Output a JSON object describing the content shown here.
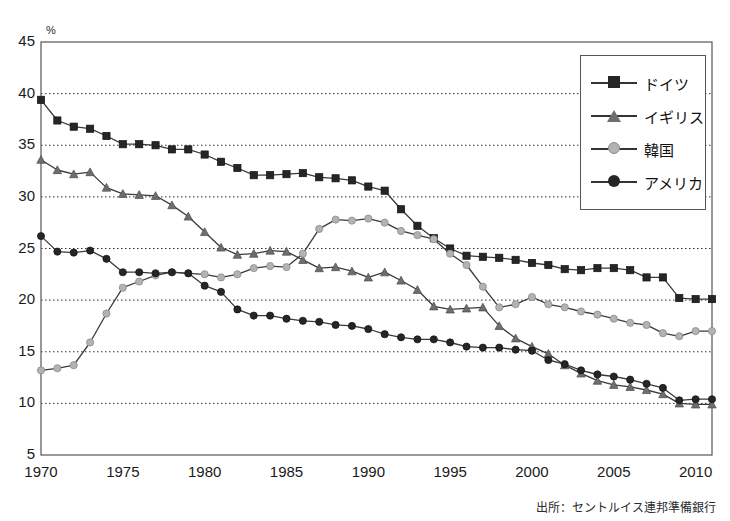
{
  "title": "",
  "y_unit": "%",
  "source": "出所：セントルイス連邦準備銀行",
  "legend": {
    "items": [
      {
        "label": "ドイツ",
        "marker": "square",
        "color": "#262626"
      },
      {
        "label": "イギリス",
        "marker": "triangle",
        "color": "#6e6e6e"
      },
      {
        "label": "韓国",
        "marker": "diamond",
        "color": "#b3b3b3"
      },
      {
        "label": "アメリカ",
        "marker": "circle",
        "color": "#262626"
      }
    ]
  },
  "chart_data": {
    "type": "line",
    "title": "",
    "xlabel": "",
    "ylabel": "%",
    "xlim": [
      1970,
      2011
    ],
    "ylim": [
      5,
      45
    ],
    "ytick_values": [
      5,
      10,
      15,
      20,
      25,
      30,
      35,
      40,
      45
    ],
    "xtick_values": [
      1970,
      1975,
      1980,
      1985,
      1990,
      1995,
      2000,
      2005,
      2010
    ],
    "grid": "horizontal-dotted",
    "legend_position": "top-right",
    "x": [
      1970,
      1971,
      1972,
      1973,
      1974,
      1975,
      1976,
      1977,
      1978,
      1979,
      1980,
      1981,
      1982,
      1983,
      1984,
      1985,
      1986,
      1987,
      1988,
      1989,
      1990,
      1991,
      1992,
      1993,
      1994,
      1995,
      1996,
      1997,
      1998,
      1999,
      2000,
      2001,
      2002,
      2003,
      2004,
      2005,
      2006,
      2007,
      2008,
      2009,
      2010,
      2011
    ],
    "series": [
      {
        "name": "ドイツ",
        "color": "#262626",
        "marker": "square",
        "values": [
          39.4,
          37.4,
          36.8,
          36.6,
          35.9,
          35.1,
          35.1,
          35.0,
          34.6,
          34.6,
          34.1,
          33.4,
          32.8,
          32.1,
          32.1,
          32.2,
          32.3,
          31.9,
          31.8,
          31.6,
          31.0,
          30.6,
          28.8,
          27.2,
          26.0,
          25.0,
          24.3,
          24.2,
          24.1,
          23.9,
          23.6,
          23.4,
          23.0,
          22.9,
          23.1,
          23.1,
          22.9,
          22.2,
          22.2,
          20.2,
          20.1,
          20.1
        ]
      },
      {
        "name": "イギリス",
        "color": "#6e6e6e",
        "marker": "triangle",
        "values": [
          33.6,
          32.6,
          32.2,
          32.4,
          30.9,
          30.3,
          30.2,
          30.1,
          29.2,
          28.1,
          26.6,
          25.1,
          24.4,
          24.5,
          24.8,
          24.7,
          23.9,
          23.1,
          23.2,
          22.8,
          22.2,
          22.7,
          21.9,
          21.0,
          19.4,
          19.1,
          19.2,
          19.3,
          17.5,
          16.3,
          15.5,
          14.8,
          13.7,
          12.9,
          12.2,
          11.8,
          11.6,
          11.3,
          10.9,
          10.0,
          9.9,
          9.9
        ]
      },
      {
        "name": "韓国",
        "color": "#b3b3b3",
        "marker": "diamond",
        "values": [
          13.2,
          13.4,
          13.7,
          15.9,
          18.7,
          21.2,
          21.8,
          22.4,
          22.7,
          22.6,
          22.5,
          22.2,
          22.5,
          23.1,
          23.3,
          23.2,
          24.5,
          26.9,
          27.8,
          27.7,
          27.9,
          27.5,
          26.7,
          26.3,
          25.9,
          24.5,
          23.4,
          21.3,
          19.3,
          19.6,
          20.3,
          19.6,
          19.3,
          18.9,
          18.6,
          18.2,
          17.8,
          17.6,
          16.8,
          16.5,
          17.0,
          17.0
        ]
      },
      {
        "name": "アメリカ",
        "color": "#262626",
        "marker": "circle",
        "values": [
          26.2,
          24.7,
          24.6,
          24.8,
          24.0,
          22.7,
          22.7,
          22.6,
          22.7,
          22.6,
          21.4,
          20.8,
          19.1,
          18.5,
          18.5,
          18.2,
          18.0,
          17.9,
          17.6,
          17.5,
          17.2,
          16.7,
          16.4,
          16.2,
          16.2,
          15.9,
          15.5,
          15.4,
          15.4,
          15.2,
          15.1,
          14.2,
          13.8,
          13.2,
          12.8,
          12.6,
          12.3,
          11.9,
          11.5,
          10.3,
          10.4,
          10.4
        ]
      }
    ]
  }
}
